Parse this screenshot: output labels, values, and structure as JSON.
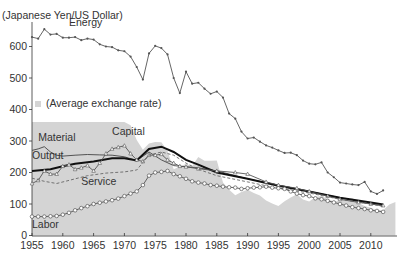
{
  "chart_data": {
    "type": "line",
    "title": "",
    "ylabel": "(Japanese Yen/US Dollar)",
    "xlabel": "",
    "ylim": [
      0,
      680
    ],
    "xlim": [
      1955,
      2014
    ],
    "grid": false,
    "x_ticks": [
      1955,
      1960,
      1965,
      1970,
      1975,
      1980,
      1985,
      1990,
      1995,
      2000,
      2005,
      2010
    ],
    "y_ticks": [
      0,
      100,
      200,
      300,
      400,
      500,
      600
    ],
    "legend": {
      "label": "(Average exchange rate)",
      "position": "middle-left"
    },
    "area": {
      "name": "Average exchange rate",
      "color": "#d4d4d4",
      "x": [
        1955,
        1970,
        1971,
        1972,
        1973,
        1974,
        1975,
        1976,
        1977,
        1978,
        1979,
        1980,
        1981,
        1982,
        1983,
        1984,
        1985,
        1986,
        1987,
        1988,
        1989,
        1990,
        1991,
        1992,
        1993,
        1994,
        1995,
        1996,
        1997,
        1998,
        1999,
        2000,
        2001,
        2002,
        2003,
        2004,
        2005,
        2006,
        2007,
        2008,
        2009,
        2010,
        2011,
        2012,
        2013,
        2014
      ],
      "values": [
        360,
        360,
        350,
        303,
        272,
        292,
        297,
        296,
        268,
        210,
        219,
        227,
        221,
        249,
        237,
        237,
        238,
        168,
        145,
        128,
        138,
        145,
        135,
        127,
        111,
        102,
        94,
        109,
        121,
        131,
        114,
        108,
        122,
        125,
        116,
        108,
        110,
        116,
        118,
        103,
        94,
        88,
        80,
        80,
        98,
        106
      ]
    },
    "series": [
      {
        "name": "Energy",
        "marker": "dot",
        "color": "#555555",
        "x": [
          1955,
          1956,
          1957,
          1958,
          1959,
          1960,
          1961,
          1962,
          1963,
          1964,
          1965,
          1966,
          1967,
          1968,
          1969,
          1970,
          1971,
          1972,
          1973,
          1974,
          1975,
          1976,
          1977,
          1978,
          1979,
          1980,
          1981,
          1982,
          1983,
          1984,
          1985,
          1986,
          1987,
          1988,
          1989,
          1990,
          1991,
          1992,
          1993,
          1994,
          1995,
          1996,
          1997,
          1998,
          1999,
          2000,
          2001,
          2002,
          2003,
          2004,
          2005,
          2006,
          2007,
          2008,
          2009,
          2010,
          2011,
          2012
        ],
        "values": [
          630,
          625,
          655,
          638,
          640,
          628,
          628,
          630,
          620,
          625,
          622,
          607,
          600,
          598,
          588,
          585,
          568,
          535,
          495,
          578,
          602,
          595,
          575,
          500,
          452,
          520,
          482,
          485,
          466,
          450,
          457,
          438,
          387,
          371,
          330,
          308,
          311,
          298,
          286,
          279,
          270,
          262,
          263,
          255,
          238,
          228,
          226,
          232,
          200,
          185,
          168,
          165,
          162,
          160,
          170,
          140,
          132,
          143
        ]
      },
      {
        "name": "Material",
        "marker": "none",
        "color": "#444444",
        "x": [
          1955,
          1956,
          1957,
          1958,
          1959,
          1960,
          1962,
          1964,
          1966,
          1968,
          1970,
          1972,
          1974,
          1976,
          1978,
          1980,
          1982,
          1985,
          1990,
          1995,
          2000,
          2005,
          2010,
          2012
        ],
        "values": [
          270,
          275,
          282,
          265,
          255,
          252,
          255,
          257,
          256,
          255,
          250,
          238,
          265,
          240,
          222,
          218,
          215,
          205,
          180,
          160,
          140,
          120,
          100,
          95
        ]
      },
      {
        "name": "Output",
        "marker": "none",
        "thick": true,
        "color": "#111111",
        "x": [
          1955,
          1958,
          1960,
          1962,
          1965,
          1968,
          1970,
          1972,
          1974,
          1976,
          1978,
          1980,
          1982,
          1985,
          1990,
          1995,
          2000,
          2005,
          2010,
          2012
        ],
        "values": [
          205,
          210,
          220,
          228,
          235,
          245,
          245,
          238,
          275,
          282,
          265,
          240,
          225,
          200,
          180,
          158,
          140,
          120,
          105,
          98
        ]
      },
      {
        "name": "Capital",
        "marker": "triangle",
        "color": "#555555",
        "x": [
          1955,
          1956,
          1957,
          1958,
          1959,
          1960,
          1961,
          1962,
          1963,
          1964,
          1965,
          1966,
          1967,
          1968,
          1969,
          1970,
          1971,
          1972,
          1973,
          1974,
          1975,
          1976,
          1977,
          1978,
          1979,
          1980,
          1982,
          1985,
          1988,
          1990,
          1993,
          1995,
          1998,
          2000,
          2003,
          2005,
          2008,
          2010,
          2012
        ],
        "values": [
          165,
          175,
          205,
          195,
          195,
          220,
          225,
          210,
          215,
          222,
          205,
          230,
          260,
          275,
          280,
          285,
          260,
          240,
          235,
          255,
          255,
          258,
          240,
          230,
          220,
          218,
          212,
          205,
          200,
          195,
          170,
          160,
          150,
          140,
          125,
          115,
          105,
          100,
          95
        ]
      },
      {
        "name": "Service",
        "marker": "none",
        "dashed": true,
        "color": "#666666",
        "x": [
          1955,
          1957,
          1959,
          1961,
          1964,
          1967,
          1970,
          1972,
          1974,
          1976,
          1978,
          1980,
          1982,
          1985,
          1990,
          1995,
          2000,
          2005,
          2010,
          2012
        ],
        "values": [
          182,
          172,
          165,
          175,
          190,
          198,
          202,
          208,
          255,
          265,
          255,
          230,
          210,
          190,
          170,
          150,
          135,
          115,
          100,
          92
        ]
      },
      {
        "name": "Labor",
        "marker": "circle",
        "color": "#555555",
        "x": [
          1955,
          1956,
          1957,
          1958,
          1959,
          1960,
          1961,
          1962,
          1963,
          1964,
          1965,
          1966,
          1967,
          1968,
          1969,
          1970,
          1971,
          1972,
          1973,
          1974,
          1975,
          1976,
          1977,
          1978,
          1979,
          1980,
          1981,
          1982,
          1983,
          1984,
          1985,
          1986,
          1987,
          1988,
          1989,
          1990,
          1991,
          1992,
          1993,
          1994,
          1995,
          1996,
          1997,
          1998,
          1999,
          2000,
          2001,
          2002,
          2003,
          2004,
          2005,
          2006,
          2007,
          2008,
          2009,
          2010,
          2011,
          2012
        ],
        "values": [
          60,
          60,
          60,
          61,
          62,
          66,
          72,
          80,
          87,
          93,
          100,
          104,
          108,
          112,
          117,
          125,
          133,
          140,
          160,
          190,
          200,
          202,
          205,
          195,
          188,
          180,
          172,
          168,
          165,
          160,
          158,
          155,
          153,
          152,
          148,
          150,
          152,
          153,
          155,
          152,
          150,
          148,
          140,
          133,
          128,
          125,
          118,
          115,
          110,
          105,
          100,
          95,
          90,
          87,
          84,
          80,
          78,
          75
        ]
      }
    ],
    "annotations": [
      {
        "text": "Energy",
        "x": 1961,
        "y": 665
      },
      {
        "text": "Material",
        "x": 1956,
        "y": 300
      },
      {
        "text": "Capital",
        "x": 1968,
        "y": 318
      },
      {
        "text": "Output",
        "x": 1955,
        "y": 242
      },
      {
        "text": "Service",
        "x": 1963,
        "y": 160
      },
      {
        "text": "Labor",
        "x": 1955,
        "y": 25
      }
    ]
  }
}
